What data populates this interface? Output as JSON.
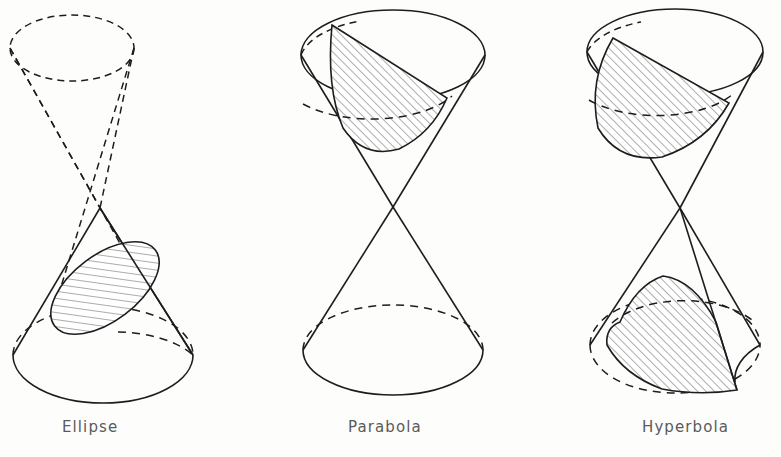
{
  "figure": {
    "background_color": "#fdfdfc",
    "stroke_color": "#1a1a1a",
    "hatch_color": "#4a4a4a",
    "caption_color": "#5a5a5a",
    "width": 781,
    "height": 457
  },
  "panels": [
    {
      "id": "ellipse",
      "label": "Ellipse",
      "label_x": 62,
      "label_y": 418,
      "cone": {
        "apex": {
          "x": 100,
          "y": 208
        },
        "lower_nappe": {
          "style": "solid",
          "base_ellipse": {
            "cx": 103,
            "cy": 355,
            "rx": 90,
            "ry": 48
          },
          "front_arc": "solid",
          "back_arc": "dashed"
        },
        "upper_nappe": {
          "style": "dashed",
          "base_ellipse": {
            "cx": 72,
            "cy": 48,
            "rx": 62,
            "ry": 33
          }
        }
      },
      "cut": {
        "type": "ellipse",
        "description": "closed oval section tilted across the lower nappe",
        "center": {
          "x": 105,
          "y": 288
        },
        "rx": 63,
        "ry": 33,
        "rotation_deg": -37,
        "hatched": true,
        "hatch_direction": "lower-left-to-upper-right"
      }
    },
    {
      "id": "parabola",
      "label": "Parabola",
      "label_x": 348,
      "label_y": 418,
      "cone": {
        "apex": {
          "x": 393,
          "y": 207
        },
        "upper_nappe": {
          "style": "solid",
          "base_ellipse": {
            "cx": 393,
            "cy": 55,
            "rx": 92,
            "ry": 45
          },
          "front_arc": "solid",
          "back_arc": "dashed"
        },
        "lower_nappe": {
          "style": "solid",
          "base_ellipse": {
            "cx": 393,
            "cy": 350,
            "rx": 90,
            "ry": 45
          },
          "front_arc": "solid",
          "back_arc": "dashed"
        }
      },
      "cut": {
        "type": "parabola",
        "description": "plane parallel to one slant side, open section on the upper nappe",
        "top_left_point": {
          "x": 332,
          "y": 25
        },
        "right_point": {
          "x": 447,
          "y": 98
        },
        "bottom_vertex": {
          "x": 350,
          "y": 150
        },
        "hatched": true,
        "hatch_direction": "lower-left-to-upper-right"
      }
    },
    {
      "id": "hyperbola",
      "label": "Hyperbola",
      "label_x": 642,
      "label_y": 418,
      "cone": {
        "apex": {
          "x": 680,
          "y": 208
        },
        "upper_nappe": {
          "style": "solid",
          "base_ellipse": {
            "cx": 675,
            "cy": 52,
            "rx": 88,
            "ry": 43
          },
          "front_arc": "solid",
          "back_arc": "dashed"
        },
        "lower_nappe": {
          "style": "solid",
          "base_ellipse": {
            "cx": 675,
            "cy": 345,
            "rx": 85,
            "ry": 48
          },
          "front_arc": "solid",
          "back_arc": "dashed"
        }
      },
      "cut": {
        "type": "hyperbola",
        "description": "vertical plane cutting both nappes, producing two open branches",
        "upper_branch_hatched": true,
        "lower_branch_hatched": true,
        "hatch_direction": "lower-left-to-upper-right"
      }
    }
  ]
}
